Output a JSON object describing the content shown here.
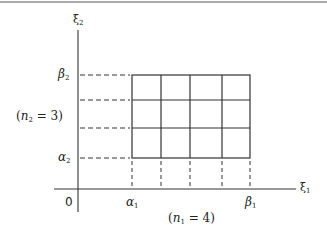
{
  "diagram": {
    "type": "rectangular-grid-partition",
    "axes": {
      "x_label": "ξ",
      "x_label_sub": "1",
      "y_label": "ξ",
      "y_label_sub": "2",
      "origin_label": "0"
    },
    "x_ticks": [
      {
        "label": "α",
        "sub": "1"
      },
      {
        "label": "β",
        "sub": "1"
      }
    ],
    "y_ticks": [
      {
        "label": "β",
        "sub": "2"
      },
      {
        "label": "α",
        "sub": "2"
      }
    ],
    "annotations": {
      "n1": {
        "prefix": "(",
        "var": "n",
        "sub": "1",
        "rest": " = 4)"
      },
      "n2": {
        "prefix": "(",
        "var": "n",
        "sub": "2",
        "rest": " = 3)"
      }
    },
    "grid": {
      "columns": 4,
      "rows": 3
    },
    "colors": {
      "line": "#333333",
      "background": "#ffffff"
    }
  }
}
